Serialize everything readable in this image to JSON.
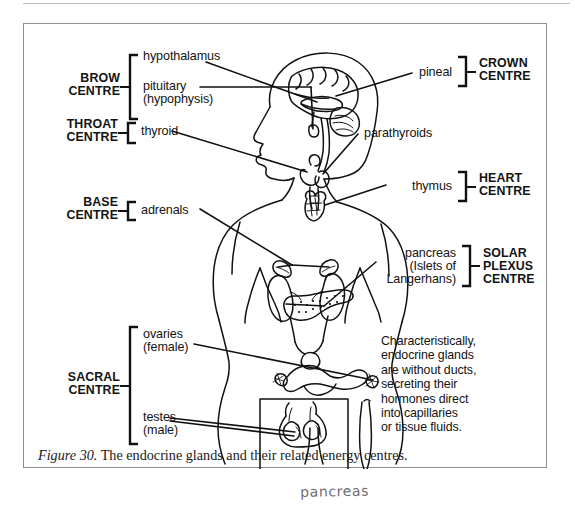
{
  "figure": {
    "caption_number": "Figure 30.",
    "caption_text": " The endocrine glands and their related energy centres."
  },
  "handwritten_note": "pancreas",
  "energy_centres": {
    "brow": {
      "line1": "BROW",
      "line2": "CENTRE"
    },
    "throat": {
      "line1": "THROAT",
      "line2": "CENTRE"
    },
    "base": {
      "line1": "BASE",
      "line2": "CENTRE"
    },
    "sacral": {
      "line1": "SACRAL",
      "line2": "CENTRE"
    },
    "crown": {
      "line1": "CROWN",
      "line2": "CENTRE"
    },
    "heart": {
      "line1": "HEART",
      "line2": "CENTRE"
    },
    "solar_plexus": {
      "line1": "SOLAR",
      "line2": "PLEXUS",
      "line3": "CENTRE"
    }
  },
  "glands": {
    "hypothalamus": "hypothalamus",
    "pituitary_l1": "pituitary",
    "pituitary_l2": "(hypophysis)",
    "thyroid": "thyroid",
    "adrenals": "adrenals",
    "ovaries_l1": "ovaries",
    "ovaries_l2": "(female)",
    "testes_l1": "testes",
    "testes_l2": "(male)",
    "pineal": "pineal",
    "parathyroids": "parathyroids",
    "thymus": "thymus",
    "pancreas_l1": "pancreas",
    "pancreas_l2": "(Islets of",
    "pancreas_l3": "Langerhans)"
  },
  "note": {
    "line1": "Characteristically,",
    "line2": "endocrine glands",
    "line3": "are without ducts,",
    "line4": "secreting their",
    "line5": "hormones direct",
    "line6": "into capillaries",
    "line7": "or tissue fluids."
  },
  "colors": {
    "ink": "#131313",
    "box_border": "#8d8d8d",
    "page_rule": "#b9b9b9",
    "handwriting": "#6f6f6f",
    "background": "#ffffff"
  }
}
